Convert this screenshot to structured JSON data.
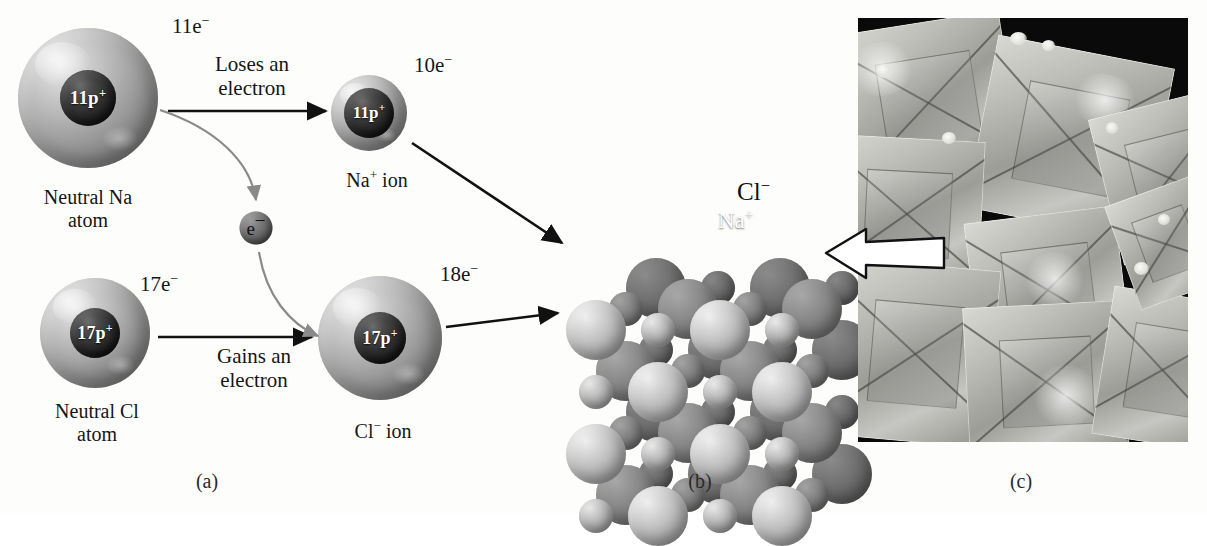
{
  "figure": {
    "panels": [
      {
        "key": "a",
        "caption": "(a)",
        "caption_x": 207
      },
      {
        "key": "b",
        "caption": "(b)",
        "caption_x": 700
      },
      {
        "key": "c",
        "caption": "(c)",
        "caption_x": 1021
      }
    ]
  },
  "panel_a": {
    "sodium_atom": {
      "electron_count_label": "11e",
      "electron_charge_sign": "−",
      "nucleus_label": "11p",
      "nucleus_charge_sign": "+",
      "name_line1": "Neutral Na",
      "name_line2": "atom"
    },
    "sodium_ion": {
      "electron_count_label": "10e",
      "electron_charge_sign": "−",
      "nucleus_label": "11p",
      "nucleus_charge_sign": "+",
      "name": "Na",
      "name_charge_sign": "+",
      "name_suffix": " ion"
    },
    "chlorine_atom": {
      "electron_count_label": "17e",
      "electron_charge_sign": "−",
      "nucleus_label": "17p",
      "nucleus_charge_sign": "+",
      "name_line1": "Neutral Cl",
      "name_line2": "atom"
    },
    "chloride_ion": {
      "electron_count_label": "18e",
      "electron_charge_sign": "−",
      "nucleus_label": "17p",
      "nucleus_charge_sign": "+",
      "name": "Cl",
      "name_charge_sign": "−",
      "name_suffix": " ion"
    },
    "free_electron": {
      "label": "e",
      "charge_sign": "−"
    },
    "process_top_line1": "Loses an",
    "process_top_line2": "electron",
    "process_bottom_line1": "Gains an",
    "process_bottom_line2": "electron"
  },
  "panel_b": {
    "chloride_label": "Cl",
    "chloride_charge_sign": "−",
    "sodium_label": "Na",
    "sodium_charge_sign": "+"
  },
  "colors": {
    "background": "#fdfdfc",
    "text": "#161616",
    "arrow_black": "#111111",
    "arrow_gray": "#8a8a8a",
    "photo_background": "#0a0a0a",
    "white_arrow_fill": "#ffffff",
    "lattice_chloride": "#c2c2c2",
    "lattice_sodium": "#b2b2b2"
  },
  "chart_data": {
    "type": "diagram",
    "lattice": {
      "description": "Face-centered cubic rock-salt lattice of alternating large Cl- and small Na+ ions",
      "large_ion": "Cl-",
      "small_ion": "Na+",
      "rows": 4,
      "columns": 4
    },
    "steps": [
      {
        "from": "Neutral Na atom",
        "to": "Na+ ion",
        "action": "Loses an electron",
        "electrons_before": 11,
        "electrons_after": 10,
        "protons": 11
      },
      {
        "from": "Neutral Cl atom",
        "to": "Cl- ion",
        "action": "Gains an electron",
        "electrons_before": 17,
        "electrons_after": 18,
        "protons": 17
      }
    ]
  }
}
